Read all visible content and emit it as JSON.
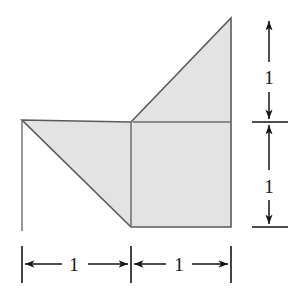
{
  "figure": {
    "shape_name": "shaded-polygon",
    "fill_color": "#e3e3e3",
    "stroke_color": "#5a5a5a",
    "dimension_color": "#141414",
    "background_color": "#ffffff",
    "vertices": [
      {
        "name": "left-apex",
        "x": 22,
        "y": 120
      },
      {
        "name": "mid-top",
        "x": 131,
        "y": 122
      },
      {
        "name": "top-right-apex",
        "x": 231,
        "y": 18
      },
      {
        "name": "bottom-right",
        "x": 231,
        "y": 227
      },
      {
        "name": "bottom-mid",
        "x": 131,
        "y": 227
      }
    ],
    "interior_lines": [
      {
        "name": "center-vertical-line",
        "x1": 131,
        "y1": 122,
        "x2": 131,
        "y2": 227
      },
      {
        "name": "mid-horizontal-line",
        "x1": 133,
        "y1": 122,
        "x2": 231,
        "y2": 122
      }
    ]
  },
  "dimensions": {
    "bottom": {
      "axis_y": 264,
      "tick_top": 246,
      "tick_bottom": 283,
      "ticks_x": [
        22,
        131,
        231
      ],
      "segments": [
        {
          "name": "bottom-left-segment",
          "label": "1",
          "x_start": 22,
          "x_end": 131,
          "label_x": 74,
          "label_y": 271
        },
        {
          "name": "bottom-right-segment",
          "label": "1",
          "x_start": 131,
          "x_end": 231,
          "label_x": 179,
          "label_y": 271
        }
      ]
    },
    "right": {
      "axis_x": 269,
      "tick_left": 252,
      "tick_right": 288,
      "ticks_y": [
        122,
        227
      ],
      "segments": [
        {
          "name": "right-top-segment",
          "label": "1",
          "y_start": 18,
          "y_end": 122,
          "label_x": 269,
          "label_y": 77
        },
        {
          "name": "right-bottom-segment",
          "label": "1",
          "y_start": 122,
          "y_end": 227,
          "label_x": 269,
          "label_y": 186
        }
      ]
    }
  }
}
